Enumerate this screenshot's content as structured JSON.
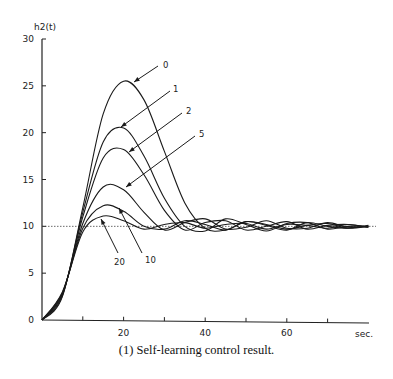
{
  "chart_data": {
    "type": "line",
    "title": "",
    "caption": "(1)  Self-learning control result.",
    "xlabel": "sec.",
    "ylabel": "h2(t)",
    "xlim": [
      0,
      80
    ],
    "ylim": [
      0,
      30
    ],
    "x_ticks": [
      10,
      20,
      30,
      40,
      50,
      60,
      70
    ],
    "x_tick_labels": [
      "",
      "20",
      "",
      "40",
      "",
      "60",
      ""
    ],
    "y_ticks": [
      0,
      5,
      10,
      15,
      20,
      25,
      30
    ],
    "y_tick_labels": [
      "0",
      "5",
      "10",
      "15",
      "20",
      "25",
      "30"
    ],
    "grid": false,
    "legend": "inline arrow annotations",
    "reference_line": {
      "y": 10,
      "style": "dotted"
    },
    "series": [
      {
        "name": "0",
        "peak_t": 20,
        "peak_value": 25.5,
        "x": [
          0,
          5,
          10,
          15,
          20,
          25,
          30,
          35,
          40,
          45,
          50,
          55,
          60,
          65,
          70,
          75,
          80
        ],
        "values": [
          0,
          2.5,
          12,
          22,
          25.5,
          23.5,
          18,
          12.5,
          9.8,
          9.6,
          10.5,
          10.2,
          9.7,
          10.1,
          10.3,
          9.8,
          10
        ]
      },
      {
        "name": "1",
        "peak_t": 19,
        "peak_value": 20.6,
        "x": [
          0,
          5,
          10,
          15,
          20,
          25,
          30,
          35,
          40,
          45,
          50,
          55,
          60,
          65,
          70,
          75,
          80
        ],
        "values": [
          0,
          2.6,
          11.5,
          19,
          20.5,
          17.5,
          13,
          10,
          9.5,
          10.8,
          10.2,
          9.5,
          10.3,
          10.4,
          9.7,
          10,
          10
        ]
      },
      {
        "name": "2",
        "peak_t": 19,
        "peak_value": 18.3,
        "x": [
          0,
          5,
          10,
          15,
          20,
          25,
          30,
          35,
          40,
          45,
          50,
          55,
          60,
          65,
          70,
          75,
          80
        ],
        "values": [
          0,
          2.7,
          11,
          17.3,
          18.2,
          15.5,
          11.7,
          9.6,
          10.4,
          10.6,
          9.6,
          10,
          10.5,
          9.7,
          10.1,
          10.2,
          9.9
        ]
      },
      {
        "name": "5",
        "peak_t": 18,
        "peak_value": 14.4,
        "x": [
          0,
          5,
          10,
          15,
          20,
          25,
          30,
          35,
          40,
          45,
          50,
          55,
          60,
          65,
          70,
          75,
          80
        ],
        "values": [
          0,
          2.8,
          10.3,
          14.2,
          13.9,
          11.5,
          9.6,
          10.4,
          10.8,
          9.7,
          9.9,
          10.6,
          9.8,
          9.8,
          10.4,
          9.9,
          10
        ]
      },
      {
        "name": "10",
        "peak_t": 17,
        "peak_value": 12.3,
        "x": [
          0,
          5,
          10,
          15,
          20,
          25,
          30,
          35,
          40,
          45,
          50,
          55,
          60,
          65,
          70,
          75,
          80
        ],
        "values": [
          0,
          2.9,
          9.8,
          12.2,
          11.6,
          10,
          9.7,
          10.6,
          10.2,
          9.6,
          10.5,
          10.1,
          9.6,
          10.4,
          10,
          9.8,
          10.1
        ]
      },
      {
        "name": "20",
        "peak_t": 16,
        "peak_value": 11.2,
        "x": [
          0,
          5,
          10,
          15,
          20,
          25,
          30,
          35,
          40,
          45,
          50,
          55,
          60,
          65,
          70,
          75,
          80
        ],
        "values": [
          0,
          3,
          9.4,
          11.1,
          10.6,
          9.7,
          10.2,
          10.4,
          9.8,
          10.2,
          10.3,
          9.7,
          10.2,
          10.1,
          9.8,
          10.2,
          9.9
        ]
      }
    ]
  }
}
